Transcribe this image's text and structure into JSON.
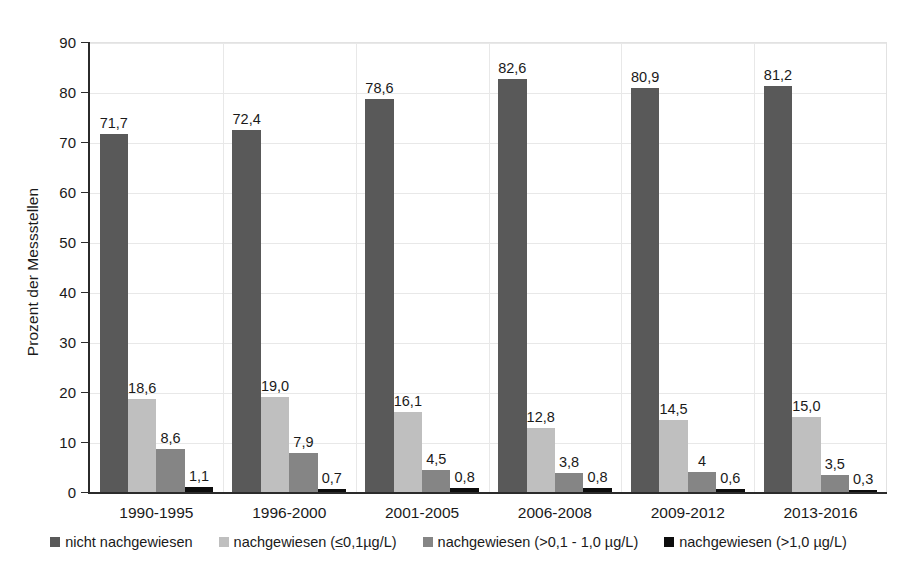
{
  "chart_data": {
    "type": "bar",
    "title": "",
    "subtitle": "",
    "xlabel": "",
    "ylabel": "Prozent der Messstellen",
    "ylim": [
      0,
      90
    ],
    "ytick_step": 10,
    "ytick_labels": [
      "0",
      "10",
      "20",
      "30",
      "40",
      "50",
      "60",
      "70",
      "80",
      "90"
    ],
    "grid": "horizontal-and-category-separators",
    "legend_position": "bottom-center",
    "decimal_separator": ",",
    "categories": [
      "1990-1995",
      "1996-2000",
      "2001-2005",
      "2006-2008",
      "2009-2012",
      "2013-2016"
    ],
    "series": [
      {
        "name": "nicht nachgewiesen",
        "color": "#595959",
        "values": [
          71.7,
          72.4,
          78.6,
          82.6,
          80.9,
          81.2
        ],
        "labels": [
          "71,7",
          "72,4",
          "78,6",
          "82,6",
          "80,9",
          "81,2"
        ]
      },
      {
        "name": "nachgewiesen (≤0,1µg/L)",
        "color": "#bfbfbf",
        "values": [
          18.6,
          19.0,
          16.1,
          12.8,
          14.5,
          15.0
        ],
        "labels": [
          "18,6",
          "19,0",
          "16,1",
          "12,8",
          "14,5",
          "15,0"
        ]
      },
      {
        "name": "nachgewiesen (>0,1 - 1,0 µg/L)",
        "color": "#858585",
        "values": [
          8.6,
          7.9,
          4.5,
          3.8,
          4.0,
          3.5
        ],
        "labels": [
          "8,6",
          "7,9",
          "4,5",
          "3,8",
          "4",
          "3,5"
        ]
      },
      {
        "name": "nachgewiesen (>1,0 µg/L)",
        "color": "#0d0d0d",
        "values": [
          1.1,
          0.7,
          0.8,
          0.8,
          0.6,
          0.3
        ],
        "labels": [
          "1,1",
          "0,7",
          "0,8",
          "0,8",
          "0,6",
          "0,3"
        ]
      }
    ]
  },
  "axis": {
    "y_title": "Prozent der Messstellen"
  },
  "legend": {
    "items": [
      {
        "label": "nicht nachgewiesen",
        "color": "#595959"
      },
      {
        "label": "nachgewiesen (≤0,1µg/L)",
        "color": "#bfbfbf"
      },
      {
        "label": "nachgewiesen (>0,1 - 1,0 µg/L)",
        "color": "#858585"
      },
      {
        "label": "nachgewiesen (>1,0 µg/L)",
        "color": "#0d0d0d"
      }
    ]
  }
}
